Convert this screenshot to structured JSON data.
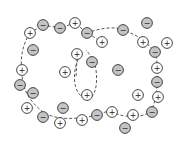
{
  "diagram": {
    "title": "",
    "colors": {
      "positive_fill": "#ffffff",
      "negative_fill": "#c4c4c4",
      "stroke": "#333333",
      "dashed_line": "#444444"
    },
    "ions": [
      {
        "sign": "+",
        "x": 30,
        "y": 33
      },
      {
        "sign": "−",
        "x": 43,
        "y": 25
      },
      {
        "sign": "−",
        "x": 60,
        "y": 28
      },
      {
        "sign": "+",
        "x": 75,
        "y": 23
      },
      {
        "sign": "−",
        "x": 87,
        "y": 33
      },
      {
        "sign": "−",
        "x": 33,
        "y": 50
      },
      {
        "sign": "+",
        "x": 102,
        "y": 42
      },
      {
        "sign": "+",
        "x": 77,
        "y": 54
      },
      {
        "sign": "−",
        "x": 92,
        "y": 62
      },
      {
        "sign": "+",
        "x": 65,
        "y": 72
      },
      {
        "sign": "−",
        "x": 118,
        "y": 70
      },
      {
        "sign": "−",
        "x": 123,
        "y": 30
      },
      {
        "sign": "−",
        "x": 147,
        "y": 23
      },
      {
        "sign": "+",
        "x": 143,
        "y": 42
      },
      {
        "sign": "+",
        "x": 167,
        "y": 43
      },
      {
        "sign": "−",
        "x": 155,
        "y": 52
      },
      {
        "sign": "+",
        "x": 157,
        "y": 68
      },
      {
        "sign": "−",
        "x": 157,
        "y": 82
      },
      {
        "sign": "+",
        "x": 158,
        "y": 97
      },
      {
        "sign": "+",
        "x": 138,
        "y": 95
      },
      {
        "sign": "+",
        "x": 22,
        "y": 70
      },
      {
        "sign": "−",
        "x": 20,
        "y": 85
      },
      {
        "sign": "−",
        "x": 33,
        "y": 93
      },
      {
        "sign": "+",
        "x": 87,
        "y": 95
      },
      {
        "sign": "+",
        "x": 27,
        "y": 108
      },
      {
        "sign": "−",
        "x": 43,
        "y": 117
      },
      {
        "sign": "−",
        "x": 63,
        "y": 108
      },
      {
        "sign": "+",
        "x": 60,
        "y": 123
      },
      {
        "sign": "+",
        "x": 82,
        "y": 120
      },
      {
        "sign": "−",
        "x": 97,
        "y": 115
      },
      {
        "sign": "+",
        "x": 112,
        "y": 112
      },
      {
        "sign": "+",
        "x": 133,
        "y": 115
      },
      {
        "sign": "−",
        "x": 152,
        "y": 112
      },
      {
        "sign": "−",
        "x": 125,
        "y": 128
      }
    ]
  }
}
